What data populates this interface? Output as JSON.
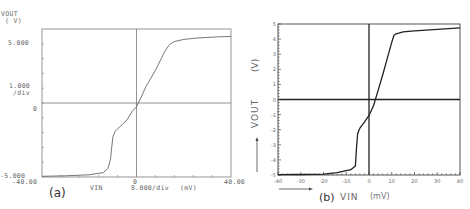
{
  "chart_data": [
    {
      "id": "a",
      "type": "line",
      "panel_label": "(a)",
      "title": "",
      "ylabel": "VOUT",
      "ylabel_unit": "( V)",
      "xlabel": "VIN",
      "x_unit": "(mV)",
      "x_scale_label": "8.000/div",
      "y_scale_label": "1.000",
      "y_scale_suffix": "/div",
      "xlim": [
        -40,
        40
      ],
      "ylim": [
        -5,
        5
      ],
      "x_tick_labels": [
        "-40.00",
        "0",
        "40.00"
      ],
      "y_tick_labels": [
        "5.000",
        "0",
        "-5.000"
      ],
      "grid": false,
      "series": [
        {
          "name": "VOUT vs VIN",
          "x": [
            -40,
            -30,
            -20,
            -14,
            -12,
            -11,
            -10.5,
            -10,
            -9,
            -8,
            -6,
            -4,
            -2,
            0,
            2,
            4,
            8,
            12,
            14,
            16,
            20,
            25,
            30,
            35,
            40
          ],
          "y": [
            -4.95,
            -4.92,
            -4.85,
            -4.7,
            -4.4,
            -3.8,
            -3.0,
            -2.3,
            -1.9,
            -1.75,
            -1.45,
            -1.15,
            -0.6,
            -0.25,
            0.4,
            1.1,
            2.2,
            3.5,
            3.95,
            4.15,
            4.3,
            4.38,
            4.43,
            4.47,
            4.5
          ]
        }
      ]
    },
    {
      "id": "b",
      "type": "line",
      "panel_label": "(b)",
      "title": "",
      "ylabel": "VOUT",
      "ylabel_unit": "(V)",
      "xlabel": "VIN",
      "x_unit": "(mV)",
      "xlim": [
        -40,
        40
      ],
      "ylim": [
        -5,
        5
      ],
      "x_tick_labels": [
        "-40",
        "-30",
        "-20",
        "-10",
        "0",
        "10",
        "20",
        "30",
        "40"
      ],
      "y_tick_labels": [
        "5",
        "4",
        "3",
        "2",
        "1",
        "0",
        "-1",
        "-2",
        "-3",
        "-4",
        "-5"
      ],
      "grid": false,
      "series": [
        {
          "name": "VOUT vs VIN",
          "x": [
            -40,
            -30,
            -20,
            -14,
            -8,
            -6,
            -5.5,
            -5,
            -4.5,
            -4,
            -2,
            0,
            2,
            4,
            6,
            8,
            10,
            11,
            12,
            15,
            20,
            30,
            40
          ],
          "y": [
            -4.98,
            -4.97,
            -4.95,
            -4.85,
            -4.65,
            -4.4,
            -3.2,
            -2.3,
            -2.05,
            -1.9,
            -1.5,
            -1.05,
            -0.4,
            0.6,
            1.6,
            2.7,
            3.8,
            4.25,
            4.35,
            4.48,
            4.55,
            4.65,
            4.75
          ]
        }
      ]
    }
  ],
  "plot_a": {
    "ylabel": "VOUT",
    "ylabel_unit": "( V)",
    "y_top": "5.000",
    "y_div": "1.000",
    "y_div_suffix": "/div",
    "y_zero": "0",
    "y_bottom": "-5.000",
    "x_left": "-40.00",
    "x_zero": "0",
    "x_right": "40.00",
    "x_label": "VIN",
    "x_div": "8.000/div",
    "x_unit": "(mV)",
    "panel_label": "(a)"
  },
  "plot_b": {
    "ylabel": "VOUT",
    "ylabel_unit": "(V)",
    "y_ticks": [
      "5",
      "4",
      "3",
      "2",
      "1",
      "0",
      "-1",
      "-2",
      "-3",
      "-4",
      "-5"
    ],
    "x_ticks": [
      "-40",
      "-30",
      "-20",
      "-10",
      "0",
      "10",
      "20",
      "30",
      "40"
    ],
    "panel_label": "(b)",
    "x_label": "VIN",
    "x_unit": "(mV)"
  }
}
